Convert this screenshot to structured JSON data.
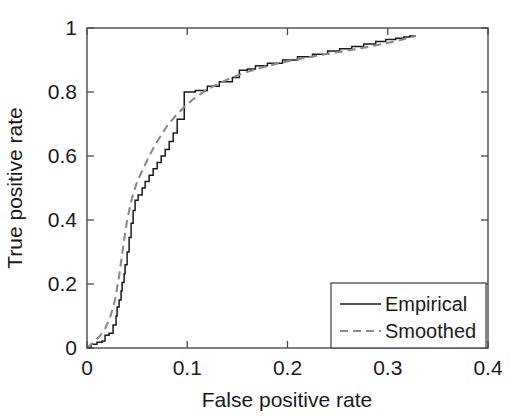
{
  "chart_data": {
    "type": "line",
    "title": "",
    "xlabel": "False positive rate",
    "ylabel": "True positive rate",
    "xlim": [
      0,
      0.4
    ],
    "ylim": [
      0,
      1
    ],
    "xticks": [
      "0",
      "0.1",
      "0.2",
      "0.3",
      "0.4"
    ],
    "xtick_values": [
      0,
      0.1,
      0.2,
      0.3,
      0.4
    ],
    "yticks": [
      "0",
      "0.2",
      "0.4",
      "0.6",
      "0.8",
      "1"
    ],
    "ytick_values": [
      0,
      0.2,
      0.4,
      0.6,
      0.8,
      1
    ],
    "grid": false,
    "legend_position": "lower right",
    "series": [
      {
        "name": "Empirical",
        "style": "solid",
        "color": "#1a1a1a",
        "drawstyle": "steps-post",
        "x": [
          0.0,
          0.004,
          0.004,
          0.01,
          0.01,
          0.015,
          0.015,
          0.018,
          0.018,
          0.022,
          0.022,
          0.026,
          0.026,
          0.029,
          0.029,
          0.03,
          0.03,
          0.032,
          0.032,
          0.034,
          0.034,
          0.035,
          0.035,
          0.037,
          0.037,
          0.038,
          0.038,
          0.04,
          0.04,
          0.042,
          0.042,
          0.044,
          0.044,
          0.046,
          0.046,
          0.048,
          0.048,
          0.051,
          0.051,
          0.055,
          0.055,
          0.058,
          0.058,
          0.062,
          0.062,
          0.066,
          0.066,
          0.07,
          0.07,
          0.074,
          0.074,
          0.078,
          0.078,
          0.082,
          0.082,
          0.086,
          0.086,
          0.09,
          0.09,
          0.097,
          0.097,
          0.108,
          0.108,
          0.12,
          0.12,
          0.132,
          0.132,
          0.145,
          0.145,
          0.152,
          0.152,
          0.16,
          0.16,
          0.168,
          0.168,
          0.18,
          0.18,
          0.195,
          0.195,
          0.21,
          0.21,
          0.225,
          0.225,
          0.24,
          0.24,
          0.252,
          0.252,
          0.264,
          0.264,
          0.276,
          0.276,
          0.288,
          0.288,
          0.298,
          0.298,
          0.308,
          0.308,
          0.316,
          0.316,
          0.322,
          0.322,
          0.328
        ],
        "y": [
          0.0,
          0.0,
          0.012,
          0.012,
          0.018,
          0.018,
          0.022,
          0.022,
          0.04,
          0.04,
          0.046,
          0.046,
          0.072,
          0.072,
          0.1,
          0.1,
          0.128,
          0.128,
          0.15,
          0.15,
          0.178,
          0.178,
          0.205,
          0.205,
          0.232,
          0.232,
          0.26,
          0.26,
          0.3,
          0.3,
          0.345,
          0.345,
          0.39,
          0.39,
          0.43,
          0.43,
          0.462,
          0.462,
          0.478,
          0.478,
          0.5,
          0.5,
          0.52,
          0.52,
          0.54,
          0.54,
          0.56,
          0.56,
          0.58,
          0.58,
          0.6,
          0.6,
          0.62,
          0.62,
          0.645,
          0.645,
          0.672,
          0.672,
          0.715,
          0.715,
          0.8,
          0.8,
          0.805,
          0.805,
          0.818,
          0.818,
          0.832,
          0.832,
          0.845,
          0.845,
          0.868,
          0.868,
          0.872,
          0.872,
          0.882,
          0.882,
          0.89,
          0.89,
          0.9,
          0.9,
          0.91,
          0.91,
          0.918,
          0.918,
          0.928,
          0.928,
          0.935,
          0.935,
          0.942,
          0.942,
          0.95,
          0.95,
          0.958,
          0.958,
          0.964,
          0.964,
          0.968,
          0.968,
          0.972,
          0.972,
          0.975,
          0.975
        ]
      },
      {
        "name": "Smoothed",
        "style": "dashed",
        "color": "#8a8a8a",
        "drawstyle": "default",
        "x": [
          0.0,
          0.006,
          0.012,
          0.018,
          0.023,
          0.028,
          0.032,
          0.036,
          0.04,
          0.045,
          0.05,
          0.056,
          0.062,
          0.068,
          0.074,
          0.08,
          0.088,
          0.096,
          0.105,
          0.115,
          0.126,
          0.138,
          0.15,
          0.163,
          0.176,
          0.19,
          0.205,
          0.22,
          0.236,
          0.252,
          0.268,
          0.284,
          0.298,
          0.31,
          0.32,
          0.328
        ],
        "y": [
          0.0,
          0.016,
          0.034,
          0.06,
          0.095,
          0.15,
          0.225,
          0.315,
          0.4,
          0.47,
          0.52,
          0.56,
          0.6,
          0.635,
          0.665,
          0.695,
          0.724,
          0.75,
          0.775,
          0.798,
          0.818,
          0.836,
          0.852,
          0.866,
          0.878,
          0.889,
          0.899,
          0.908,
          0.917,
          0.925,
          0.934,
          0.943,
          0.952,
          0.96,
          0.968,
          0.975
        ]
      }
    ],
    "legend_entries": [
      {
        "label": "Empirical",
        "style": "solid",
        "color": "#1a1a1a"
      },
      {
        "label": "Smoothed",
        "style": "dashed",
        "color": "#8a8a8a"
      }
    ]
  },
  "axes": {
    "x_title": "False positive rate",
    "y_title": "True positive rate",
    "x_tick_labels": [
      "0",
      "0.1",
      "0.2",
      "0.3",
      "0.4"
    ],
    "y_tick_labels": [
      "0",
      "0.2",
      "0.4",
      "0.6",
      "0.8",
      "1"
    ]
  },
  "legend": {
    "empirical_label": "Empirical",
    "smoothed_label": "Smoothed"
  },
  "colors": {
    "background": "#ffffff",
    "axis": "#4a4a4a",
    "empirical": "#1a1a1a",
    "smoothed": "#8a8a8a",
    "text": "#1a1a1a"
  }
}
